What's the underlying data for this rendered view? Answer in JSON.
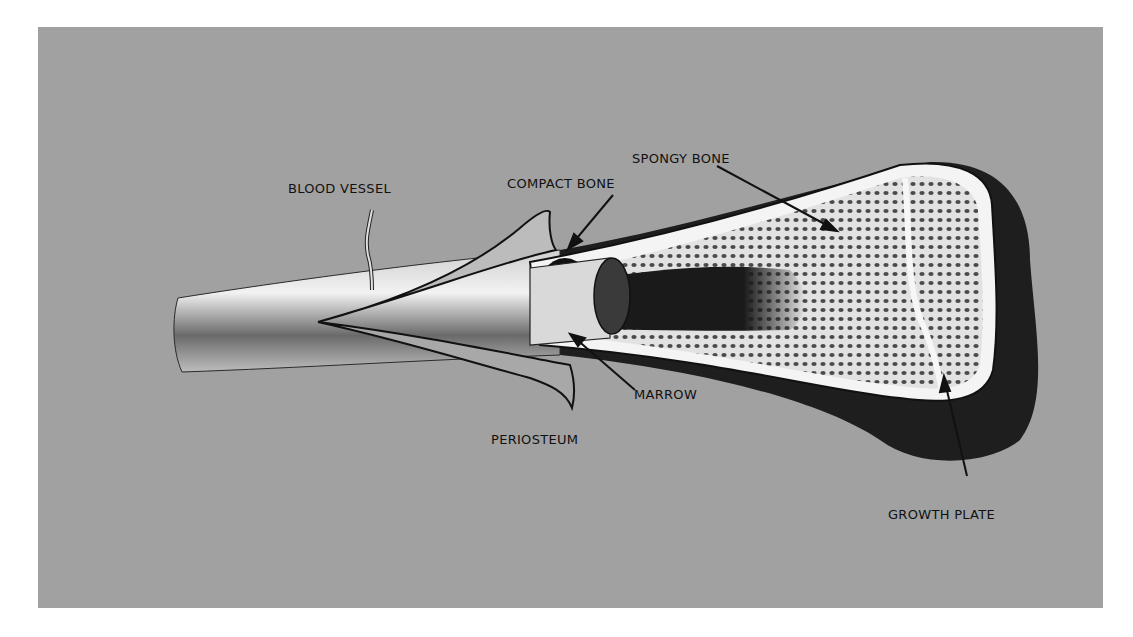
{
  "diagram": {
    "colors": {
      "background": "#a1a1a1",
      "page": "#ffffff",
      "bone_light": "#e8e8e8",
      "bone_dark": "#1a1a1a",
      "label_text": "#111111"
    },
    "labels": [
      {
        "id": "blood-vessel",
        "text": "BLOOD VESSEL"
      },
      {
        "id": "compact-bone",
        "text": "COMPACT BONE"
      },
      {
        "id": "spongy-bone",
        "text": "SPONGY BONE"
      },
      {
        "id": "marrow",
        "text": "MARROW"
      },
      {
        "id": "periosteum",
        "text": "PERIOSTEUM"
      },
      {
        "id": "growth-plate",
        "text": "GROWTH PLATE"
      }
    ]
  }
}
